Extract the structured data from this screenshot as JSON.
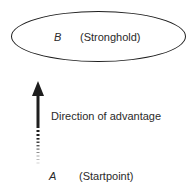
{
  "diagram": {
    "stronghold": {
      "variable": "B",
      "label": "(Stronghold)"
    },
    "startpoint": {
      "variable": "A",
      "label": "(Startpoint)"
    },
    "arrow": {
      "label": "Direction of advantage",
      "direction": "up",
      "color": "#1e1e1e"
    }
  }
}
